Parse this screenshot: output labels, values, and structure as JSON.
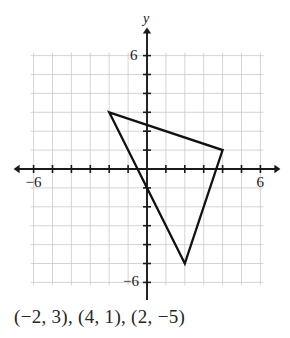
{
  "figure": {
    "caption": "(−2, 3), (4, 1), (2, −5)",
    "y_axis_name": "y",
    "labels": {
      "x_left": "−6",
      "x_right": "6",
      "y_top": "6",
      "y_bottom": "−6"
    },
    "colors": {
      "grid": "#c9c9c9",
      "axis": "#1a1a1a",
      "shape": "#111111",
      "text": "#262626",
      "background": "#ffffff"
    }
  },
  "chart_data": {
    "type": "scatter",
    "title": "",
    "xlabel": "",
    "ylabel": "y",
    "xlim": [
      -7,
      7
    ],
    "ylim": [
      -7,
      7
    ],
    "xticks": [
      -6,
      -5,
      -4,
      -3,
      -2,
      -1,
      0,
      1,
      2,
      3,
      4,
      5,
      6
    ],
    "yticks": [
      -6,
      -5,
      -4,
      -3,
      -2,
      -1,
      0,
      1,
      2,
      3,
      4,
      5,
      6
    ],
    "xtick_labels_shown": [
      "−6",
      "6"
    ],
    "ytick_labels_shown": [
      "6",
      "−6"
    ],
    "grid": true,
    "grid_spacing": 1,
    "legend": "none",
    "annotations": [
      "(−2, 3), (4, 1), (2, −5)"
    ],
    "series": [
      {
        "name": "triangle",
        "shape": "polygon",
        "closed": true,
        "stroke": "#111111",
        "fill": "none",
        "points": [
          {
            "label": "A",
            "x": -2,
            "y": 3
          },
          {
            "label": "B",
            "x": 4,
            "y": 1
          },
          {
            "label": "C",
            "x": 2,
            "y": -5
          }
        ]
      }
    ]
  }
}
